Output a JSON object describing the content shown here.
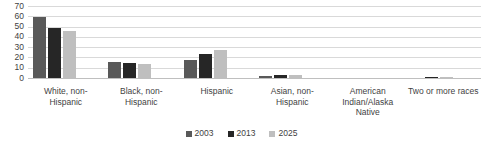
{
  "chart_data": {
    "type": "bar",
    "title": "",
    "xlabel": "",
    "ylabel": "",
    "ylim": [
      0,
      70
    ],
    "yticks": [
      70,
      60,
      50,
      40,
      30,
      20,
      10,
      0
    ],
    "grid": true,
    "legend_position": "bottom",
    "categories": [
      "White, non-Hispanic",
      "Black, non-Hispanic",
      "Hispanic",
      "Asian, non-Hispanic",
      "American Indian/Alaska Native",
      "Two or more races"
    ],
    "series": [
      {
        "name": "2003",
        "color": "#595959",
        "values": [
          59,
          16,
          18,
          2,
          0,
          0
        ]
      },
      {
        "name": "2013",
        "color": "#262626",
        "values": [
          49,
          15,
          23,
          3,
          0,
          1
        ]
      },
      {
        "name": "2025",
        "color": "#bfbfbf",
        "values": [
          46,
          14,
          27,
          3,
          0,
          1
        ]
      }
    ]
  },
  "colors": {
    "series_2003": "#595959",
    "series_2013": "#262626",
    "series_2025": "#bfbfbf",
    "gridline": "#d9d9d9",
    "axis": "#bfbfbf",
    "text": "#3f3f3f",
    "background": "#ffffff"
  }
}
